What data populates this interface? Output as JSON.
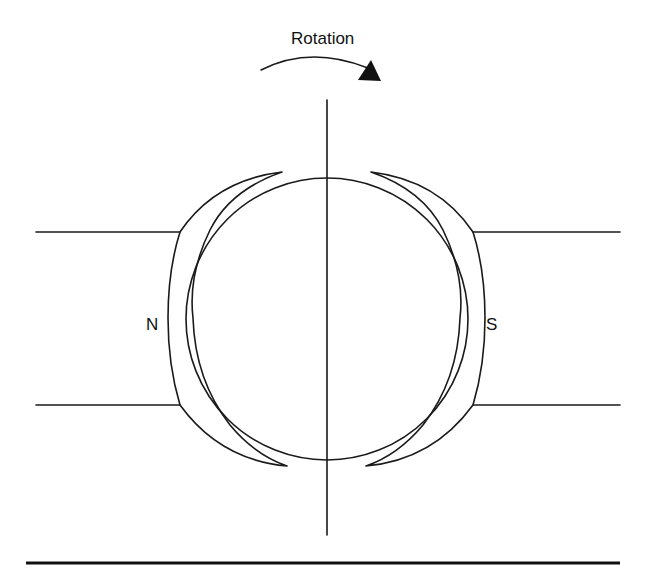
{
  "diagram": {
    "type": "DC generator / motor schematic (armature between magnetic poles)",
    "rotation_label": "Rotation",
    "poles": {
      "left": {
        "label": "N"
      },
      "right": {
        "label": "S"
      }
    },
    "elements": [
      "rotation-arrow",
      "armature-circle",
      "vertical-axis",
      "left-pole-shoe",
      "right-pole-shoe",
      "left-pole-body",
      "right-pole-body",
      "baseline"
    ],
    "colors": {
      "stroke": "#1a1a1a",
      "background": "#ffffff"
    }
  }
}
